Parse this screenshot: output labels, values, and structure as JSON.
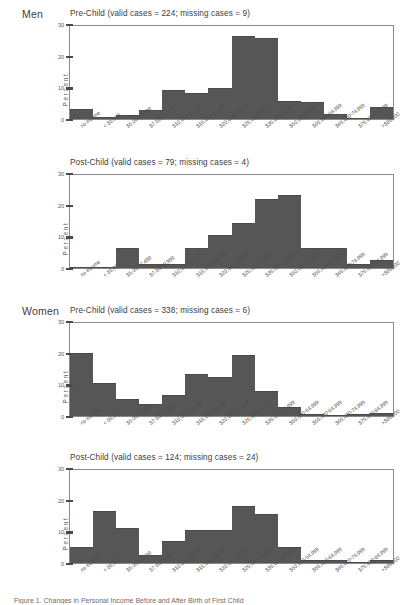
{
  "figure": {
    "caption": "Figure 1. Changes in Personal Income Before and After Birth of First Child"
  },
  "axis": {
    "ylabel": "Percent",
    "yticks": [
      "30",
      "20",
      "10",
      "0"
    ],
    "ylim": [
      0,
      30
    ],
    "categories": [
      "no income",
      "< $5,000",
      "$5,000-7,499",
      "$7,500-9,999",
      "$10,000-14,999",
      "$15,000-19,999",
      "$20,000-24,999",
      "$25,000-34,999",
      "$35,000-49,999",
      "$50,000-54,999",
      "$55,000-64,999",
      "$65,000-74,999",
      "$75,000-84,999",
      ">$85,000"
    ]
  },
  "groups": [
    {
      "label": "Men"
    },
    {
      "label": "Women"
    }
  ],
  "panels": [
    {
      "group": "Men",
      "title": "Pre-Child (valid cases = 224; missing cases = 9)"
    },
    {
      "group": "",
      "title": "Post-Child (valid cases = 79; missing cases = 4)"
    },
    {
      "group": "Women",
      "title": "Pre-Child (valid cases = 338; missing cases = 6)"
    },
    {
      "group": "",
      "title": "Post-Child (valid cases = 124; missing cases = 24)"
    }
  ],
  "colors": {
    "bar": "#565656",
    "frame": "#8a8a8a",
    "text": "#3c3c3c"
  },
  "chart_data": [
    {
      "type": "bar",
      "title": "Pre-Child (valid cases = 224; missing cases = 9)",
      "group": "Men",
      "xlabel": "",
      "ylabel": "Percent",
      "ylim": [
        0,
        30
      ],
      "grid": false,
      "legend": "none",
      "categories": [
        "no income",
        "< $5,000",
        "$5,000-7,499",
        "$7,500-9,999",
        "$10,000-14,999",
        "$15,000-19,999",
        "$20,000-24,999",
        "$25,000-34,999",
        "$35,000-49,999",
        "$50,000-54,999",
        "$55,000-64,999",
        "$65,000-74,999",
        "$75,000-84,999",
        ">$85,000"
      ],
      "values": [
        3.0,
        0.4,
        0.9,
        2.5,
        9.0,
        8.0,
        9.4,
        26.0,
        25.3,
        5.5,
        5.0,
        1.2,
        0.0,
        3.6
      ]
    },
    {
      "type": "bar",
      "title": "Post-Child (valid cases = 79; missing cases = 4)",
      "group": "Men",
      "xlabel": "",
      "ylabel": "Percent",
      "ylim": [
        0,
        30
      ],
      "grid": false,
      "legend": "none",
      "categories": [
        "no income",
        "< $5,000",
        "$5,000-7,499",
        "$7,500-9,999",
        "$10,000-14,999",
        "$15,000-19,999",
        "$20,000-24,999",
        "$25,000-34,999",
        "$35,000-49,999",
        "$50,000-54,999",
        "$55,000-64,999",
        "$65,000-74,999",
        "$75,000-84,999",
        ">$85,000"
      ],
      "values": [
        0.0,
        0.0,
        6.1,
        1.0,
        1.0,
        6.1,
        10.2,
        14.0,
        21.6,
        22.7,
        6.1,
        6.1,
        1.0,
        2.1
      ]
    },
    {
      "type": "bar",
      "title": "Pre-Child (valid cases = 338; missing cases = 6)",
      "group": "Women",
      "xlabel": "",
      "ylabel": "Percent",
      "ylim": [
        0,
        30
      ],
      "grid": false,
      "legend": "none",
      "categories": [
        "no income",
        "< $5,000",
        "$5,000-7,499",
        "$7,500-9,999",
        "$10,000-14,999",
        "$15,000-19,999",
        "$20,000-24,999",
        "$25,000-34,999",
        "$35,000-49,999",
        "$50,000-54,999",
        "$55,000-64,999",
        "$65,000-74,999",
        "$75,000-84,999",
        ">$85,000"
      ],
      "values": [
        19.5,
        10.2,
        5.0,
        3.6,
        6.2,
        12.8,
        12.0,
        18.8,
        7.6,
        2.4,
        0.3,
        0.0,
        0.3,
        0.5
      ]
    },
    {
      "type": "bar",
      "title": "Post-Child (valid cases = 124; missing cases = 24)",
      "group": "Women",
      "xlabel": "",
      "ylabel": "Percent",
      "ylim": [
        0,
        30
      ],
      "grid": false,
      "legend": "none",
      "categories": [
        "no income",
        "< $5,000",
        "$5,000-7,499",
        "$7,500-9,999",
        "$10,000-14,999",
        "$15,000-19,999",
        "$20,000-24,999",
        "$25,000-34,999",
        "$35,000-49,999",
        "$50,000-54,999",
        "$55,000-64,999",
        "$65,000-74,999",
        "$75,000-84,999",
        ">$85,000"
      ],
      "values": [
        4.8,
        16.0,
        10.6,
        2.2,
        6.5,
        10.0,
        10.0,
        17.6,
        15.3,
        4.8,
        0.6,
        0.6,
        0.0,
        0.6
      ]
    }
  ]
}
